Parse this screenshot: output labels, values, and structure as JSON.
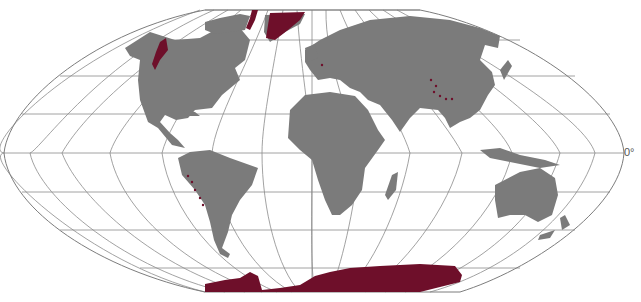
{
  "map": {
    "title": "",
    "projection": "flat-polar pseudocylindrical world map",
    "equator_label": "0°",
    "colors": {
      "background": "#ffffff",
      "land": "#7b7b7b",
      "glaciated": "#6e0f2a",
      "graticule": "#8a8a8a"
    },
    "graticule": {
      "parallels_y": [
        14,
        40,
        76,
        114,
        153,
        192,
        230,
        268,
        292
      ],
      "meridian_count": 17
    },
    "highlighted_regions": [
      "Greenland ice sheet",
      "Antarctic ice sheet",
      "Canadian Arctic islands (Ellesmere/Baffin)",
      "Alaska / Pacific Northwest coast ranges",
      "Andes glaciers",
      "Alps",
      "Himalaya / Karakoram / Tien Shan",
      "Southern Alps (New Zealand)"
    ]
  }
}
